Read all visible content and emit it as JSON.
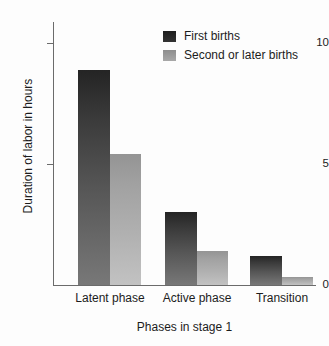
{
  "chart_data": {
    "type": "bar",
    "title": "",
    "subtitle": "",
    "xlabel": "Phases in stage 1",
    "ylabel": "Duration of labor in hours",
    "categories": [
      "Latent phase",
      "Active phase",
      "Transition"
    ],
    "series": [
      {
        "name": "First births",
        "values": [
          8.9,
          3.0,
          1.2
        ],
        "color": "#2a2a2a"
      },
      {
        "name": "Second or later births",
        "values": [
          5.4,
          1.4,
          0.35
        ],
        "color": "#a0a0a0"
      }
    ],
    "ylim": [
      0,
      11
    ],
    "yticks": [
      0,
      5,
      10
    ],
    "ytick_labels": [
      "0",
      "5",
      "10"
    ],
    "grid": false,
    "legend_position": "top-right"
  },
  "axes": {
    "y_title": "Duration of labor in hours",
    "x_title": "Phases in stage 1",
    "y_ticks": [
      {
        "label": "10",
        "value": 10
      },
      {
        "label": "5",
        "value": 5
      },
      {
        "label": "0",
        "value": 0
      }
    ]
  },
  "legend": {
    "items": [
      {
        "label": "First births",
        "swatch": "dark-gradient-swatch"
      },
      {
        "label": "Second or later births",
        "swatch": "gray-gradient-swatch"
      }
    ]
  },
  "categories": [
    {
      "label": "Latent phase"
    },
    {
      "label": "Active phase"
    },
    {
      "label": "Transition"
    }
  ],
  "colors": {
    "series_first_top": "#242424",
    "series_first_bottom": "#787878",
    "series_second_top": "#949494",
    "series_second_bottom": "#c2c2c2",
    "axis": "#6b6b6b",
    "text": "#1c1c1c",
    "background": "#fdfdfd"
  }
}
